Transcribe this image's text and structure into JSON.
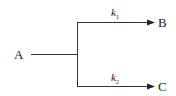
{
  "diagram": {
    "type": "parallel-reaction",
    "nodes": [
      {
        "id": "A",
        "label": "A"
      },
      {
        "id": "B",
        "label": "B"
      },
      {
        "id": "C",
        "label": "C"
      }
    ],
    "edges": [
      {
        "from": "A",
        "to": "B",
        "rate_symbol": "k",
        "rate_subscript": "1"
      },
      {
        "from": "A",
        "to": "C",
        "rate_symbol": "k",
        "rate_subscript": "2"
      }
    ],
    "line_color": "#333333"
  }
}
